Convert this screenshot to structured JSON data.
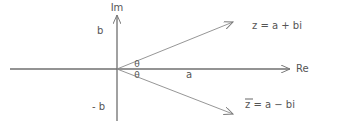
{
  "diagram": {
    "axes": {
      "imaginary_label": "Im",
      "real_label": "Re"
    },
    "labels": {
      "b_positive": "b",
      "b_negative": "- b",
      "a": "a",
      "theta_upper": "θ",
      "theta_lower": "θ"
    },
    "vectors": [
      {
        "id": "z",
        "label": "z = a + bi",
        "direction": "upper-right"
      },
      {
        "id": "z_conjugate",
        "label": "z = a − bi",
        "overline": true,
        "direction": "lower-right"
      }
    ],
    "colors": {
      "axis": "#6f6f6f",
      "vector": "#8a8a8a",
      "text": "#555555",
      "background": "#ffffff"
    }
  }
}
